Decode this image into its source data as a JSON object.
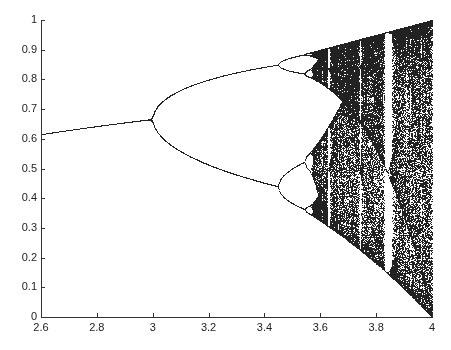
{
  "chart_data": {
    "type": "scatter",
    "title": "",
    "xlabel": "",
    "ylabel": "",
    "xlim": [
      2.6,
      4
    ],
    "ylim": [
      0,
      1
    ],
    "grid": false,
    "legend": null,
    "x_ticks": [
      "2.6",
      "2.8",
      "3",
      "3.2",
      "3.4",
      "3.6",
      "3.8",
      "4"
    ],
    "y_ticks": [
      "0",
      "0.1",
      "0.2",
      "0.3",
      "0.4",
      "0.5",
      "0.6",
      "0.7",
      "0.8",
      "0.9",
      "1"
    ],
    "annotations": [],
    "key_points": {
      "fixed_point_at_r_2.6": 0.615,
      "first_bifurcation_r": 3.0,
      "first_bifurcation_x": 0.667,
      "second_bifurcation_r": 3.449,
      "period2_branches_at_r_3.449": [
        0.44,
        0.85
      ],
      "onset_of_chaos_r": 3.57,
      "period3_window_r": [
        3.828,
        3.857
      ]
    },
    "series": [
      {
        "name": "logistic map attractor",
        "color": "#222222",
        "r_steps": 900,
        "transient": 300,
        "samples": 200
      }
    ]
  },
  "plot_area": {
    "left": 41,
    "top": 20,
    "right": 432,
    "bottom": 317
  }
}
